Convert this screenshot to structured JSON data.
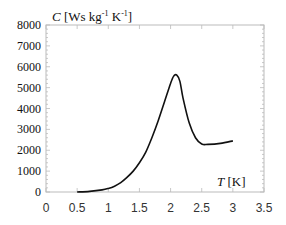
{
  "chart_data": {
    "type": "line",
    "title": "",
    "xlabel": "T [K]",
    "ylabel": "C [Ws kg-1 K-1]",
    "ylabel_parts": {
      "var": "C",
      "unit_pre": "[Ws kg",
      "exp1": "-1",
      "unit_mid": " K",
      "exp2": "-1",
      "unit_post": "]"
    },
    "xlabel_parts": {
      "var": "T",
      "unit": "[K]"
    },
    "xlim": [
      0,
      3.5
    ],
    "ylim": [
      0,
      8000
    ],
    "x_ticks": [
      "0",
      "0.5",
      "1",
      "1.5",
      "2",
      "2.5",
      "3",
      "3.5"
    ],
    "y_ticks": [
      "0",
      "1000",
      "2000",
      "3000",
      "4000",
      "5000",
      "6000",
      "7000",
      "8000"
    ],
    "grid": false,
    "legend": null,
    "series": [
      {
        "name": "specific heat",
        "color": "#111111",
        "x": [
          0.5,
          0.7,
          0.9,
          1.0,
          1.1,
          1.2,
          1.3,
          1.4,
          1.5,
          1.6,
          1.7,
          1.8,
          1.9,
          2.0,
          2.05,
          2.1,
          2.15,
          2.2,
          2.3,
          2.4,
          2.5,
          2.6,
          2.8,
          3.0
        ],
        "values": [
          0,
          30,
          100,
          170,
          280,
          450,
          700,
          1000,
          1400,
          1900,
          2600,
          3400,
          4300,
          5200,
          5550,
          5600,
          5300,
          4500,
          3300,
          2600,
          2300,
          2280,
          2330,
          2450
        ]
      }
    ]
  }
}
